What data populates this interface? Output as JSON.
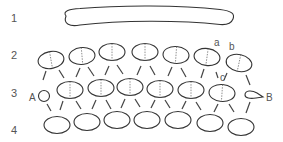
{
  "diagram": {
    "row_labels": [
      "1",
      "2",
      "3",
      "4"
    ],
    "rows": {
      "row1": {
        "shape": "elongated-curved-bar",
        "count": 1
      },
      "row2": {
        "shape": "ellipse-with-dashed-divider",
        "count": 7
      },
      "row3": {
        "shape": "ellipse-with-dashed-divider",
        "count": 6,
        "start_marker": "A",
        "end_marker": "B"
      },
      "row4": {
        "shape": "ellipse",
        "count": 7
      }
    },
    "point_labels": {
      "a": "a",
      "b": "b",
      "c": "c",
      "A": "A",
      "B": "B"
    },
    "arrows": "each row-2 ellipse has two arrows pointing down to neighbouring row-3 shapes; each row-3 shape has two arrows pointing down to row-4 ellipses"
  }
}
